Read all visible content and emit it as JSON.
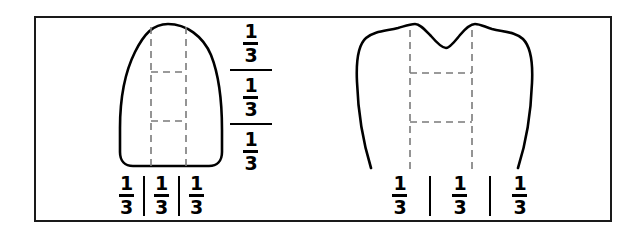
{
  "figure": {
    "background_color": "#ffffff",
    "frame_color": "#1a1a1a",
    "line_color": "#000000",
    "dashed_line_color": "#7a7a7a"
  },
  "left_diagram": {
    "name": "anterior-tooth-incisor",
    "shape": "incisor crown outline with rounded flat incisal edge",
    "vertical_divisions": 3,
    "horizontal_divisions": 3,
    "vertical_fraction_stack": [
      {
        "numerator": "1",
        "denominator": "3"
      },
      {
        "numerator": "1",
        "denominator": "3"
      },
      {
        "numerator": "1",
        "denominator": "3"
      }
    ],
    "horizontal_fraction_row": [
      {
        "numerator": "1",
        "denominator": "3"
      },
      {
        "numerator": "1",
        "denominator": "3"
      },
      {
        "numerator": "1",
        "denominator": "3"
      }
    ]
  },
  "right_diagram": {
    "name": "posterior-tooth-molar",
    "shape": "molar crown outline with two cusps and central notch",
    "vertical_divisions": 3,
    "horizontal_divisions": 3,
    "horizontal_fraction_row": [
      {
        "numerator": "1",
        "denominator": "3"
      },
      {
        "numerator": "1",
        "denominator": "3"
      },
      {
        "numerator": "1",
        "denominator": "3"
      }
    ]
  }
}
